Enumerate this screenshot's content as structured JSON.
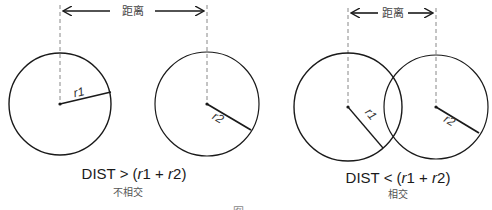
{
  "colors": {
    "stroke": "#1a1a1a",
    "dash": "#888888",
    "text": "#1a1a1a",
    "caption": "#555555"
  },
  "panels": [
    {
      "id": "non-intersecting",
      "distance_label": "距离",
      "radius_labels": [
        "r1",
        "r2"
      ],
      "formula": {
        "prefix": "DIST > (",
        "r1_var": "r",
        "r1_sub": "1",
        "plus": " + ",
        "r2_var": "r",
        "r2_sub": "2",
        "suffix": ")"
      },
      "caption": "不相交"
    },
    {
      "id": "intersecting",
      "distance_label": "距离",
      "radius_labels": [
        "r1",
        "r2"
      ],
      "formula": {
        "prefix": "DIST < (",
        "r1_var": "r",
        "r1_sub": "1",
        "plus": " + ",
        "r2_var": "r",
        "r2_sub": "2",
        "suffix": ")"
      },
      "caption": "相交"
    }
  ],
  "figure_mark": "图"
}
